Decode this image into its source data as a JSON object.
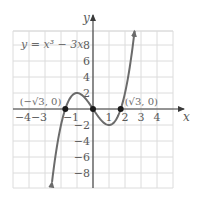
{
  "chart_data": {
    "type": "line",
    "title": "",
    "equation_label": "y = x³ − 3x",
    "xlabel": "x",
    "ylabel": "y",
    "xlim": [
      -5,
      5
    ],
    "ylim": [
      -10,
      10
    ],
    "grid": true,
    "x_ticks": [
      {
        "value": -4,
        "label": "−4"
      },
      {
        "value": -3,
        "label": "−3"
      },
      {
        "value": -1,
        "label": "−1"
      },
      {
        "value": 1,
        "label": "1"
      },
      {
        "value": 2,
        "label": "2"
      },
      {
        "value": 3,
        "label": "3"
      },
      {
        "value": 4,
        "label": "4"
      }
    ],
    "y_ticks": [
      {
        "value": 8,
        "label": "8"
      },
      {
        "value": 6,
        "label": "6"
      },
      {
        "value": 4,
        "label": "4"
      },
      {
        "value": 2,
        "label": "2"
      },
      {
        "value": -2,
        "label": "−2"
      },
      {
        "value": -4,
        "label": "−4"
      },
      {
        "value": -6,
        "label": "−6"
      },
      {
        "value": -8,
        "label": "−8"
      }
    ],
    "series": [
      {
        "name": "y = x^3 - 3x",
        "function": "x^3 - 3x",
        "x_range": [
          -2.56,
          2.6
        ],
        "arrows": "both",
        "color": "#6b6b6b"
      }
    ],
    "points": [
      {
        "x": -1.732,
        "y": 0,
        "label": "(−√3, 0)"
      },
      {
        "x": 0,
        "y": 0,
        "label": ""
      },
      {
        "x": 1.732,
        "y": 0,
        "label": "(√3, 0)"
      }
    ],
    "colors": {
      "grid": "#dcdcdc",
      "axis": "#3a3a3a",
      "curve": "#6b6b6b",
      "point": "#1a1a1a",
      "text": "#5a5a5a"
    }
  }
}
